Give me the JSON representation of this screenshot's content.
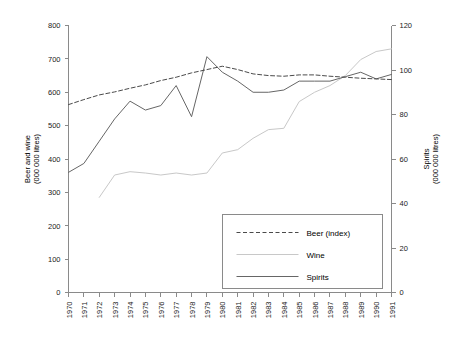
{
  "chart_data": {
    "type": "line",
    "title": "",
    "xlabel": "",
    "ylabel": "Beer and wine\n(000 000 litres)",
    "y2label": "Spirits\n(000 000 litres)",
    "ylabel_line1": "Beer and wine",
    "ylabel_line2": "(000 000 litres)",
    "y2label_line1": "Spirits",
    "y2label_line2": "(000 000 litres)",
    "grid": false,
    "legend_position": "bottom-right",
    "ylim": [
      0,
      800
    ],
    "y2lim": [
      0,
      120
    ],
    "yticks": [
      0,
      100,
      200,
      300,
      400,
      500,
      600,
      700,
      800
    ],
    "y2ticks": [
      0,
      20,
      40,
      60,
      80,
      100,
      120
    ],
    "categories": [
      "1970",
      "1971",
      "1972",
      "1973",
      "1974",
      "1975",
      "1976",
      "1977",
      "1978",
      "1979",
      "1980",
      "1981",
      "1982",
      "1983",
      "1984",
      "1985",
      "1986",
      "1987",
      "1988",
      "1989",
      "1990",
      "1991"
    ],
    "series": [
      {
        "name": "Beer (index)",
        "axis": "left",
        "style": "dashed",
        "color": "#4a4a4a",
        "values": [
          563,
          578,
          592,
          601,
          612,
          622,
          635,
          645,
          658,
          668,
          678,
          668,
          655,
          650,
          648,
          652,
          652,
          648,
          645,
          642,
          640,
          638
        ]
      },
      {
        "name": "Wine",
        "axis": "left",
        "style": "solid",
        "color": "#c8c8c8",
        "values": [
          null,
          null,
          285,
          352,
          362,
          358,
          352,
          358,
          352,
          358,
          418,
          428,
          462,
          488,
          492,
          572,
          600,
          620,
          650,
          698,
          722,
          730
        ]
      },
      {
        "name": "Spirits",
        "axis": "right",
        "style": "solid",
        "color": "#666666",
        "values": [
          54,
          58,
          68,
          78,
          86,
          82,
          84,
          93,
          79,
          106,
          99,
          95,
          90,
          90,
          91,
          95,
          95,
          95,
          97,
          99,
          96,
          98
        ]
      }
    ],
    "spirits_left_scale_values": [
      362,
      390,
      455,
      522,
      575,
      548,
      560,
      620,
      530,
      705,
      660,
      632,
      602,
      598,
      607,
      632,
      632,
      634,
      648,
      660,
      640,
      652
    ]
  },
  "legend": {
    "items": [
      {
        "label": "Beer (index)",
        "style": "dashed"
      },
      {
        "label": "Wine",
        "style": "solid-light"
      },
      {
        "label": "Spirits",
        "style": "solid-dark"
      }
    ]
  }
}
